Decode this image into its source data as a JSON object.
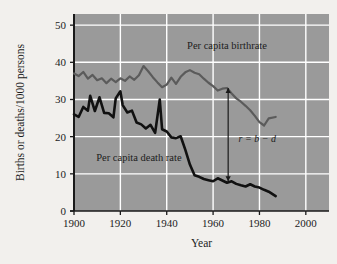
{
  "chart_data": {
    "type": "line",
    "title": "",
    "xlabel": "Year",
    "ylabel": "Births or deaths/1000 persons",
    "xlim": [
      1900,
      2010
    ],
    "ylim": [
      0,
      53
    ],
    "xticks": [
      1900,
      1920,
      1940,
      1960,
      1980,
      2000
    ],
    "yticks": [
      0,
      10,
      20,
      30,
      40,
      50
    ],
    "xtick_labels": [
      "1900",
      "1920",
      "1940",
      "1960",
      "1980",
      "2000"
    ],
    "ytick_labels": [
      "0",
      "10",
      "20",
      "30",
      "40",
      "50"
    ],
    "grid": true,
    "grid_color": "#ffffff",
    "plot_background": "#9a9a9a",
    "legend_position": "inline-annotation",
    "series": [
      {
        "name": "Per capita birthrate",
        "color": "#5b5b5b",
        "label": "Per capita birthrate",
        "label_x": 1966,
        "label_y": 43.5,
        "x": [
          1900,
          1902,
          1904,
          1906,
          1908,
          1910,
          1912,
          1914,
          1916,
          1918,
          1920,
          1922,
          1924,
          1926,
          1928,
          1930,
          1932,
          1934,
          1936,
          1938,
          1940,
          1942,
          1944,
          1946,
          1948,
          1950,
          1952,
          1954,
          1956,
          1958,
          1960,
          1962,
          1964,
          1966,
          1968,
          1970,
          1972,
          1974,
          1976,
          1978,
          1980,
          1982,
          1984,
          1987
        ],
        "values": [
          37.0,
          36.3,
          37.4,
          35.6,
          36.6,
          35.2,
          35.7,
          34.4,
          35.6,
          34.7,
          35.7,
          35.0,
          36.2,
          35.3,
          36.5,
          39.0,
          37.6,
          36.0,
          34.6,
          33.3,
          34.0,
          35.9,
          34.2,
          36.1,
          37.3,
          37.9,
          37.2,
          36.8,
          35.6,
          34.5,
          33.6,
          32.4,
          32.9,
          33.1,
          31.6,
          30.3,
          29.4,
          28.3,
          27.1,
          25.6,
          23.9,
          23.0,
          24.9,
          25.3
        ]
      },
      {
        "name": "Per capita death rate",
        "color": "#111111",
        "label": "Per capita death rate",
        "label_x": 1928,
        "label_y": 13.5,
        "x": [
          1900,
          1902,
          1904,
          1906,
          1907,
          1909,
          1911,
          1913,
          1915,
          1917,
          1918,
          1920,
          1921,
          1923,
          1925,
          1927,
          1929,
          1931,
          1933,
          1935,
          1937,
          1938,
          1940,
          1942,
          1944,
          1946,
          1948,
          1950,
          1952,
          1954,
          1956,
          1958,
          1960,
          1962,
          1964,
          1966,
          1968,
          1970,
          1972,
          1974,
          1976,
          1978,
          1980,
          1982,
          1984,
          1987
        ],
        "values": [
          26.0,
          25.3,
          28.0,
          27.0,
          31.0,
          26.9,
          30.6,
          26.4,
          26.3,
          25.2,
          30.3,
          32.2,
          28.5,
          26.5,
          27.0,
          23.8,
          23.3,
          22.2,
          23.2,
          21.0,
          30.0,
          22.0,
          21.4,
          19.8,
          19.6,
          20.1,
          16.5,
          12.5,
          9.6,
          9.2,
          8.6,
          8.3,
          8.0,
          8.8,
          8.2,
          7.6,
          8.0,
          7.3,
          6.9,
          6.6,
          7.2,
          6.6,
          6.3,
          5.7,
          5.2,
          4.0
        ]
      }
    ],
    "annotations": [
      {
        "text": "r = b − d",
        "x": 1971,
        "y": 18.5,
        "type": "formula",
        "arrow": {
          "x": 1966.5,
          "y_top": 33.1,
          "y_bottom": 8.0,
          "double_headed": true,
          "color": "#1a1a1a"
        }
      }
    ]
  }
}
